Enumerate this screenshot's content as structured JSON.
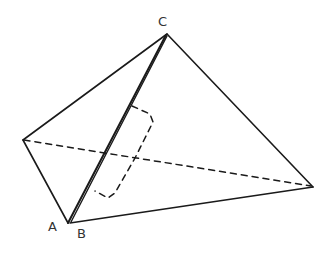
{
  "diagram": {
    "labels": {
      "C": "C",
      "A": "A",
      "B": "B"
    },
    "stroke_color": "#1a1a1a",
    "background": "#ffffff"
  }
}
